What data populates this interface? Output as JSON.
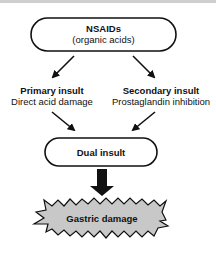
{
  "diagram": {
    "top_node": {
      "title": "NSAIDs",
      "subtitle": "(organic acids)"
    },
    "left_node": {
      "title": "Primary insult",
      "subtitle": "Direct acid damage"
    },
    "right_node": {
      "title": "Secondary insult",
      "subtitle": "Prostaglandin inhibition"
    },
    "middle_node": {
      "title": "Dual insult"
    },
    "bottom_node": {
      "title": "Gastric damage"
    },
    "colors": {
      "stroke": "#111111",
      "starburst_fill": "#c8c8c8",
      "background": "#ffffff"
    }
  }
}
